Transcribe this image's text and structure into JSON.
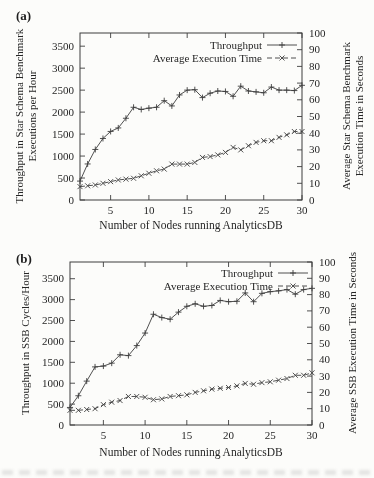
{
  "colors": {
    "ink": "#3d3d3d",
    "text": "#262626",
    "background": "#fcfcfa"
  },
  "chart_data": [
    {
      "type": "line",
      "panel_label": "(a)",
      "xlabel": "Number of Nodes running AnalyticsDB",
      "ylabel_left": "Throughput in Star Schema Benchmark\nExecutions per Hour",
      "ylabel_right": "Average Star Schema Benchmark\nExecution Time in Seconds",
      "xlim": [
        1,
        30
      ],
      "ylim_left": [
        0,
        3800
      ],
      "ylim_right": [
        0,
        100
      ],
      "xticks": [
        5,
        10,
        15,
        20,
        25,
        30
      ],
      "yticks_left": [
        0,
        500,
        1000,
        1500,
        2000,
        2500,
        3000,
        3500
      ],
      "yticks_right": [
        0,
        10,
        20,
        30,
        40,
        50,
        60,
        70,
        80,
        90,
        100
      ],
      "grid": false,
      "legend_position": "top-right",
      "x": [
        1,
        2,
        3,
        4,
        5,
        6,
        7,
        8,
        9,
        10,
        11,
        12,
        13,
        14,
        15,
        16,
        17,
        18,
        19,
        20,
        21,
        22,
        23,
        24,
        25,
        26,
        27,
        28,
        29,
        30
      ],
      "series": [
        {
          "name": "Throughput",
          "axis": "left",
          "line_style": "solid",
          "marker": "plus",
          "values": [
            430,
            820,
            1150,
            1400,
            1560,
            1640,
            1860,
            2110,
            2060,
            2090,
            2110,
            2260,
            2140,
            2390,
            2500,
            2510,
            2330,
            2430,
            2480,
            2470,
            2360,
            2590,
            2480,
            2460,
            2440,
            2570,
            2500,
            2500,
            2490,
            2610
          ]
        },
        {
          "name": "Average Execution Time",
          "axis": "right",
          "line_style": "dashed",
          "marker": "x",
          "values": [
            8,
            8.5,
            9,
            10,
            11,
            12,
            12.5,
            13,
            14.5,
            16,
            17.5,
            18.5,
            21.5,
            21.5,
            21.5,
            22.5,
            25.5,
            26,
            27,
            28.5,
            31.5,
            30,
            32.5,
            34.5,
            35.5,
            35.5,
            37.5,
            39,
            41,
            41
          ]
        }
      ]
    },
    {
      "type": "line",
      "panel_label": "(b)",
      "xlabel": "Number of Nodes running AnalyticsDB",
      "ylabel_left": "Throughput in SSB Cycles/Hour",
      "ylabel_right": "Average SSB Execution Time in Seconds",
      "xlim": [
        1,
        30
      ],
      "ylim_left": [
        0,
        3900
      ],
      "ylim_right": [
        0,
        100
      ],
      "xticks": [
        5,
        10,
        15,
        20,
        25,
        30
      ],
      "yticks_left": [
        0,
        500,
        1000,
        1500,
        2000,
        2500,
        3000,
        3500
      ],
      "yticks_right": [
        0,
        10,
        20,
        30,
        40,
        50,
        60,
        70,
        80,
        90,
        100
      ],
      "grid": false,
      "legend_position": "top-right",
      "x": [
        1,
        2,
        3,
        4,
        5,
        6,
        7,
        8,
        9,
        10,
        11,
        12,
        13,
        14,
        15,
        16,
        17,
        18,
        19,
        20,
        21,
        22,
        23,
        24,
        25,
        26,
        27,
        28,
        29,
        30
      ],
      "series": [
        {
          "name": "Throughput",
          "axis": "left",
          "line_style": "solid",
          "marker": "plus",
          "values": [
            420,
            700,
            1050,
            1390,
            1410,
            1480,
            1680,
            1660,
            1900,
            2200,
            2650,
            2570,
            2530,
            2700,
            2840,
            2900,
            2840,
            2860,
            2980,
            2950,
            2960,
            3160,
            2950,
            3150,
            3190,
            3210,
            3240,
            3130,
            3240,
            3270
          ]
        },
        {
          "name": "Average Execution Time",
          "axis": "right",
          "line_style": "dashed",
          "marker": "x",
          "values": [
            9,
            9,
            9.5,
            10,
            12.5,
            14,
            15,
            17.5,
            17.5,
            17,
            15.5,
            16,
            17.5,
            18,
            18.5,
            20,
            21,
            22,
            22.5,
            23,
            24,
            25.5,
            25,
            26,
            26.5,
            27.5,
            28.5,
            30.5,
            30.5,
            32
          ]
        }
      ]
    }
  ]
}
